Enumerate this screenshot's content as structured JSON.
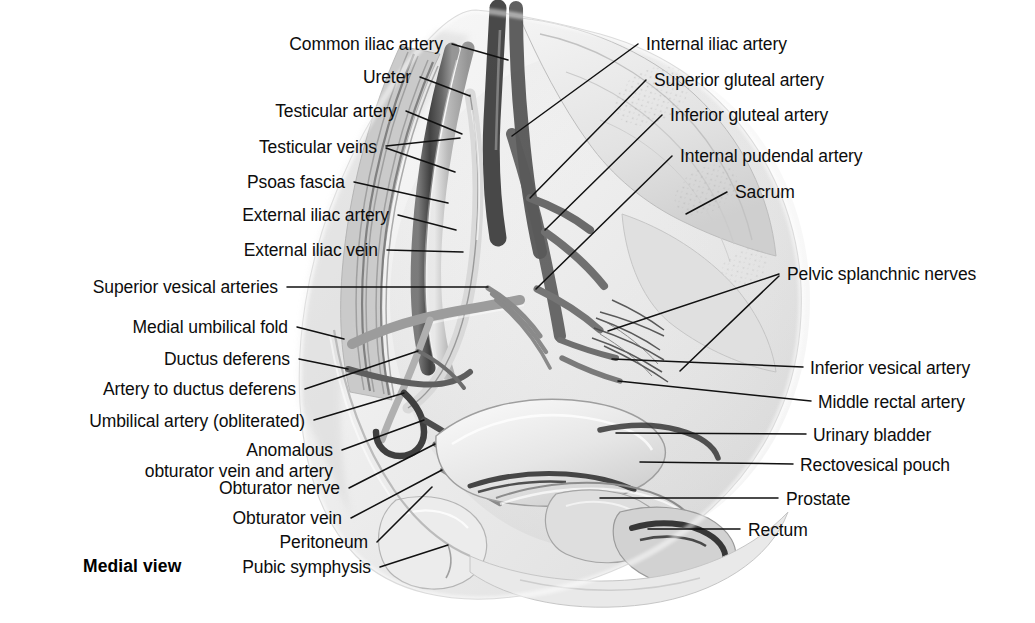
{
  "figure": {
    "caption": "Medial view",
    "caption_pos": {
      "x": 83,
      "y": 556
    },
    "background": "#ffffff",
    "ink": "#0d0d0d",
    "leader_color": "#111111",
    "width": 1035,
    "height": 623
  },
  "labels_left": [
    {
      "text": "Common iliac artery",
      "x": 443,
      "y": 34,
      "align": "right",
      "leaders": [
        [
          452,
          44,
          508,
          60
        ]
      ]
    },
    {
      "text": "Ureter",
      "x": 411,
      "y": 67,
      "align": "right",
      "leaders": [
        [
          420,
          77,
          470,
          96
        ]
      ]
    },
    {
      "text": "Testicular artery",
      "x": 397,
      "y": 101,
      "align": "right",
      "leaders": [
        [
          406,
          111,
          462,
          134
        ]
      ]
    },
    {
      "text": "Testicular veins",
      "x": 377,
      "y": 137,
      "align": "right",
      "leaders": [
        [
          386,
          146,
          460,
          138
        ],
        [
          386,
          148,
          455,
          172
        ]
      ]
    },
    {
      "text": "Psoas fascia",
      "x": 345,
      "y": 172,
      "align": "right",
      "leaders": [
        [
          354,
          182,
          448,
          203
        ]
      ]
    },
    {
      "text": "External iliac artery",
      "x": 389,
      "y": 205,
      "align": "right",
      "leaders": [
        [
          398,
          215,
          456,
          230
        ]
      ]
    },
    {
      "text": "External iliac vein",
      "x": 378,
      "y": 240,
      "align": "right",
      "leaders": [
        [
          387,
          250,
          463,
          252
        ]
      ]
    },
    {
      "text": "Superior vesical arteries",
      "x": 278,
      "y": 277,
      "align": "right",
      "leaders": [
        [
          287,
          287,
          488,
          287
        ]
      ]
    },
    {
      "text": "Medial umbilical fold",
      "x": 288,
      "y": 317,
      "align": "right",
      "leaders": [
        [
          297,
          327,
          344,
          339
        ]
      ]
    },
    {
      "text": "Ductus deferens",
      "x": 290,
      "y": 349,
      "align": "right",
      "leaders": [
        [
          299,
          359,
          348,
          369
        ]
      ]
    },
    {
      "text": "Artery to ductus deferens",
      "x": 296,
      "y": 379,
      "align": "right",
      "leaders": [
        [
          305,
          389,
          418,
          351
        ]
      ]
    },
    {
      "text": "Umbilical artery (obliterated)",
      "x": 305,
      "y": 411,
      "align": "right",
      "leaders": [
        [
          314,
          420,
          404,
          393
        ]
      ]
    },
    {
      "text": "Anomalous\nobturator vein and artery",
      "x": 333,
      "y": 440,
      "align": "right",
      "two_line": true,
      "leaders": [
        [
          342,
          450,
          424,
          420
        ]
      ]
    },
    {
      "text": "Obturator nerve",
      "x": 340,
      "y": 478,
      "align": "right",
      "leaders": [
        [
          349,
          488,
          435,
          444
        ]
      ]
    },
    {
      "text": "Obturator vein",
      "x": 342,
      "y": 508,
      "align": "right",
      "leaders": [
        [
          351,
          518,
          442,
          470
        ]
      ]
    },
    {
      "text": "Peritoneum",
      "x": 368,
      "y": 532,
      "align": "right",
      "leaders": [
        [
          377,
          542,
          432,
          487
        ]
      ]
    },
    {
      "text": "Pubic symphysis",
      "x": 371,
      "y": 557,
      "align": "right",
      "leaders": [
        [
          380,
          567,
          448,
          545
        ]
      ]
    }
  ],
  "labels_right": [
    {
      "text": "Internal iliac artery",
      "x": 646,
      "y": 34,
      "align": "left",
      "leaders": [
        [
          638,
          44,
          512,
          136
        ]
      ]
    },
    {
      "text": "Superior gluteal artery",
      "x": 654,
      "y": 70,
      "align": "left",
      "leaders": [
        [
          646,
          80,
          530,
          198
        ]
      ]
    },
    {
      "text": "Inferior gluteal artery",
      "x": 670,
      "y": 105,
      "align": "left",
      "leaders": [
        [
          662,
          115,
          545,
          230
        ]
      ]
    },
    {
      "text": "Internal pudendal artery",
      "x": 680,
      "y": 146,
      "align": "left",
      "leaders": [
        [
          672,
          156,
          536,
          289
        ]
      ]
    },
    {
      "text": "Sacrum",
      "x": 735,
      "y": 182,
      "align": "left",
      "leaders": [
        [
          727,
          192,
          686,
          214
        ]
      ]
    },
    {
      "text": "Pelvic splanchnic nerves",
      "x": 787,
      "y": 264,
      "align": "left",
      "leaders": [
        [
          779,
          274,
          608,
          331
        ],
        [
          779,
          276,
          680,
          371
        ]
      ]
    },
    {
      "text": "Inferior vesical artery",
      "x": 810,
      "y": 358,
      "align": "left",
      "leaders": [
        [
          803,
          367,
          612,
          359
        ]
      ]
    },
    {
      "text": "Middle rectal artery",
      "x": 818,
      "y": 392,
      "align": "left",
      "leaders": [
        [
          811,
          401,
          618,
          381
        ]
      ]
    },
    {
      "text": "Urinary bladder",
      "x": 813,
      "y": 425,
      "align": "left",
      "leaders": [
        [
          806,
          434,
          616,
          433
        ]
      ]
    },
    {
      "text": "Rectovesical pouch",
      "x": 800,
      "y": 455,
      "align": "left",
      "leaders": [
        [
          793,
          464,
          640,
          462
        ]
      ]
    },
    {
      "text": "Prostate",
      "x": 786,
      "y": 489,
      "align": "left",
      "leaders": [
        [
          778,
          498,
          600,
          498
        ]
      ]
    },
    {
      "text": "Rectum",
      "x": 748,
      "y": 520,
      "align": "left",
      "leaders": [
        [
          740,
          529,
          648,
          529
        ]
      ]
    }
  ]
}
